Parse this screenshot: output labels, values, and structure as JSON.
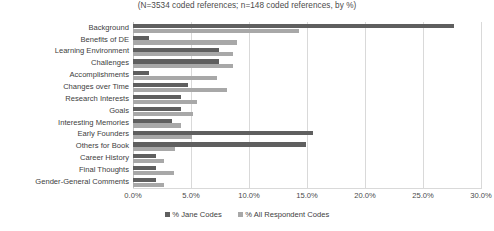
{
  "chart_data": {
    "type": "bar",
    "orientation": "horizontal",
    "title": "(N=3534 coded references; n=148 coded references, by %)",
    "xlabel": "",
    "ylabel": "",
    "xlim": [
      0,
      30
    ],
    "xticks": [
      "0.0%",
      "5.0%",
      "10.0%",
      "15.0%",
      "20.0%",
      "25.0%",
      "30.0%"
    ],
    "xtick_values": [
      0,
      5,
      10,
      15,
      20,
      25,
      30
    ],
    "grid": true,
    "legend_position": "bottom",
    "categories": [
      "Background",
      "Benefits of DE",
      "Learning Environment",
      "Challenges",
      "Accomplishments",
      "Changes over Time",
      "Research Interests",
      "Goals",
      "Interesting Memories",
      "Early Founders",
      "Others for Book",
      "Career History",
      "Final Thoughts",
      "Gender-General Comments"
    ],
    "series": [
      {
        "name": "% Jane Codes",
        "color": "#5f5f5f",
        "values": [
          27.7,
          1.4,
          7.4,
          7.4,
          1.4,
          4.7,
          4.1,
          4.1,
          3.4,
          15.5,
          14.9,
          2.0,
          2.0,
          2.0
        ]
      },
      {
        "name": "% All Respondent Codes",
        "color": "#a8a8a8",
        "values": [
          14.3,
          9.0,
          8.6,
          8.6,
          7.2,
          8.1,
          5.5,
          5.2,
          4.1,
          5.1,
          3.6,
          2.7,
          3.5,
          2.7
        ]
      }
    ]
  },
  "legend": {
    "items": [
      {
        "label": "% Jane Codes",
        "color": "#5f5f5f"
      },
      {
        "label": "% All Respondent Codes",
        "color": "#a8a8a8"
      }
    ]
  },
  "colors": {
    "series_jane": "#5f5f5f",
    "series_all": "#a8a8a8",
    "gridline": "#d9d9d9",
    "text": "#404040",
    "background": "#ffffff"
  }
}
